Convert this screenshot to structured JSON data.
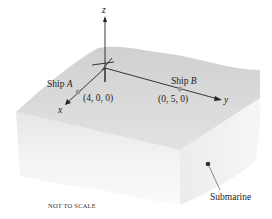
{
  "diagram": {
    "axes": {
      "z_label": "z",
      "x_label": "x",
      "y_label": "y"
    },
    "ship_a": {
      "label_prefix": "Ship ",
      "label_letter": "A",
      "coords": "(4, 0, 0)"
    },
    "ship_b": {
      "label_prefix": "Ship ",
      "label_letter": "B",
      "coords": "(0, 5, 0)"
    },
    "submarine": {
      "label": "Submarine"
    },
    "note": "NOT TO SCALE",
    "colors": {
      "ocean_top": "#d9d9d9",
      "ocean_side": "#ebebeb",
      "axis": "#222222",
      "ship_marker": "#9a9a9a",
      "submarine_marker": "#333333"
    }
  }
}
